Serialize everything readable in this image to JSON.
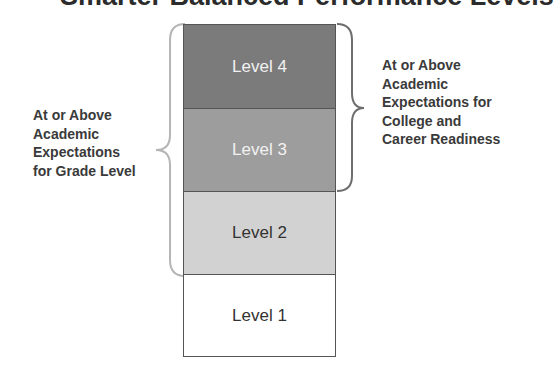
{
  "title": "Smarter Balanced Performance Levels",
  "levels": [
    {
      "label": "Level 4",
      "fill": "#7b7b7b",
      "text_color": "#f2f2f2"
    },
    {
      "label": "Level 3",
      "fill": "#9d9d9d",
      "text_color": "#f2f2f2"
    },
    {
      "label": "Level 2",
      "fill": "#d2d2d2",
      "text_color": "#333333"
    },
    {
      "label": "Level 1",
      "fill": "#ffffff",
      "text_color": "#333333"
    }
  ],
  "left_annotation": {
    "lines": [
      "At or Above",
      "Academic",
      "Expectations",
      "for Grade Level"
    ],
    "spans": "Level 4 through Level 2",
    "brace_color": "#b5b5b5"
  },
  "right_annotation": {
    "lines": [
      "At or Above",
      "Academic",
      "Expectations for",
      "College and",
      "Career Readiness"
    ],
    "spans": "Level 4 through Level 3",
    "brace_color": "#6e6e6e"
  }
}
